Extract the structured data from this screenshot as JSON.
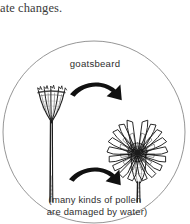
{
  "page": {
    "body_text_fragment": "ate changes."
  },
  "figure": {
    "name": "goatsbeard-opening-closing-cycle",
    "cycle_label": "goatsbeard",
    "caption": {
      "line_1": "(many kinds of pollen",
      "line_2": "are damaged by water)"
    },
    "elements": {
      "closed_flower_label": "closed goatsbeard flower head",
      "open_flower_label": "open goatsbeard flower head",
      "arrow_opening_label": "opening arrow",
      "arrow_closing_label": "closing arrow",
      "circle_frame_label": "circular figure border"
    },
    "colors": {
      "background": "#ffffff",
      "ink": "#1a1a1a",
      "line": "#7d7d7d",
      "text": "#2e2e2e",
      "body_text": "#3a3a3a"
    }
  }
}
